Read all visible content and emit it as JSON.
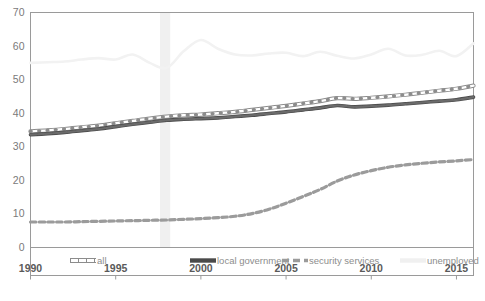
{
  "chart_data": {
    "type": "line",
    "title": "",
    "subtitle": "",
    "xlabel": "",
    "ylabel": "",
    "xlim": [
      1990,
      2016
    ],
    "ylim": [
      0,
      70
    ],
    "grid": false,
    "legend_position": "bottom",
    "y_ticks": [
      "0",
      "10",
      "20",
      "30",
      "40",
      "50",
      "60",
      "70"
    ],
    "y_tick_values": [
      0,
      10,
      20,
      30,
      40,
      50,
      60,
      70
    ],
    "x_ticks": [
      "1990",
      "1995",
      "2000",
      "2005",
      "2010",
      "2015"
    ],
    "x_tick_values": [
      1990,
      1995,
      2000,
      2005,
      2010,
      2015
    ],
    "x": [
      1990,
      1991,
      1992,
      1993,
      1994,
      1995,
      1996,
      1997,
      1998,
      1999,
      2000,
      2001,
      2002,
      2003,
      2004,
      2005,
      2006,
      2007,
      2008,
      2009,
      2010,
      2011,
      2012,
      2013,
      2014,
      2015,
      2016
    ],
    "highlight_band": {
      "label": "1998",
      "start": 1997.6,
      "end": 1998.2,
      "color": "#f0f0f0"
    },
    "series": [
      {
        "name": "all",
        "style": "outlined-white",
        "color": "#ffffff",
        "edge_color": "#8c8c8c",
        "values": [
          34.6,
          34.9,
          35.3,
          35.8,
          36.3,
          37.0,
          37.7,
          38.4,
          39.0,
          39.4,
          39.6,
          40.0,
          40.4,
          41.0,
          41.6,
          42.2,
          42.9,
          43.6,
          44.5,
          44.3,
          44.6,
          45.0,
          45.5,
          46.1,
          46.7,
          47.3,
          48.2
        ]
      },
      {
        "name": "local government",
        "style": "solid-dark",
        "color": "#6b6b6b",
        "edge_color": "#4a4a4a",
        "values": [
          33.6,
          33.9,
          34.3,
          34.8,
          35.3,
          36.0,
          36.7,
          37.3,
          37.9,
          38.2,
          38.4,
          38.6,
          39.0,
          39.4,
          39.9,
          40.4,
          41.0,
          41.6,
          42.3,
          41.9,
          42.1,
          42.4,
          42.8,
          43.2,
          43.6,
          44.0,
          44.8
        ]
      },
      {
        "name": "security services",
        "style": "dashed-gray",
        "color": "#9b9b9b",
        "edge_color": "#9b9b9b",
        "values": [
          7.6,
          7.6,
          7.6,
          7.7,
          7.8,
          7.9,
          8.0,
          8.1,
          8.2,
          8.4,
          8.6,
          8.9,
          9.3,
          10.1,
          11.4,
          13.2,
          15.2,
          17.3,
          19.8,
          21.6,
          22.9,
          23.9,
          24.6,
          25.1,
          25.5,
          25.8,
          26.2
        ]
      },
      {
        "name": "unemployed",
        "style": "solid-light",
        "color": "#f2f2f2",
        "edge_color": "#f2f2f2",
        "values": [
          55.0,
          55.2,
          55.4,
          56.0,
          56.4,
          56.0,
          57.5,
          55.0,
          53.5,
          58.5,
          61.8,
          59.2,
          57.5,
          57.2,
          57.8,
          58.0,
          57.0,
          58.3,
          57.1,
          56.3,
          57.5,
          59.2,
          57.2,
          57.4,
          58.6,
          57.0,
          60.8
        ]
      }
    ],
    "legend": [
      {
        "label": "all",
        "marker": "outlined-white"
      },
      {
        "label": "local government",
        "marker": "solid-dark"
      },
      {
        "label": "security services",
        "marker": "dashed-gray"
      },
      {
        "label": "unemployed",
        "marker": "solid-light"
      }
    ]
  }
}
